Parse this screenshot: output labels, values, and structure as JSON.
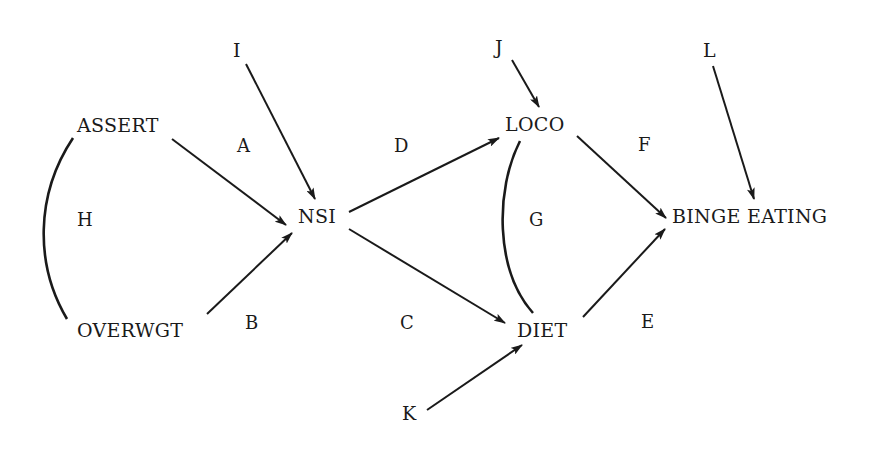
{
  "diagram": {
    "type": "path-diagram",
    "nodes": {
      "assert": "ASSERT",
      "overwgt": "OVERWGT",
      "nsi": "NSI",
      "loco": "LOCO",
      "diet": "DIET",
      "binge": "BINGE EATING"
    },
    "exogenous": {
      "i": "I",
      "j": "J",
      "k": "K",
      "l": "L"
    },
    "path_labels": {
      "a": "A",
      "b": "B",
      "c": "C",
      "d": "D",
      "e": "E",
      "f": "F",
      "g": "G",
      "h": "H"
    },
    "edges": [
      {
        "from": "ASSERT",
        "to": "NSI",
        "label": "A",
        "kind": "directed"
      },
      {
        "from": "OVERWGT",
        "to": "NSI",
        "label": "B",
        "kind": "directed"
      },
      {
        "from": "NSI",
        "to": "DIET",
        "label": "C",
        "kind": "directed"
      },
      {
        "from": "NSI",
        "to": "LOCO",
        "label": "D",
        "kind": "directed"
      },
      {
        "from": "DIET",
        "to": "BINGE EATING",
        "label": "E",
        "kind": "directed"
      },
      {
        "from": "LOCO",
        "to": "BINGE EATING",
        "label": "F",
        "kind": "directed"
      },
      {
        "from": "LOCO",
        "to": "DIET",
        "label": "G",
        "kind": "correlation"
      },
      {
        "from": "ASSERT",
        "to": "OVERWGT",
        "label": "H",
        "kind": "correlation"
      },
      {
        "from": "I",
        "to": "NSI",
        "label": "",
        "kind": "disturbance"
      },
      {
        "from": "J",
        "to": "LOCO",
        "label": "",
        "kind": "disturbance"
      },
      {
        "from": "K",
        "to": "DIET",
        "label": "",
        "kind": "disturbance"
      },
      {
        "from": "L",
        "to": "BINGE EATING",
        "label": "",
        "kind": "disturbance"
      }
    ]
  }
}
